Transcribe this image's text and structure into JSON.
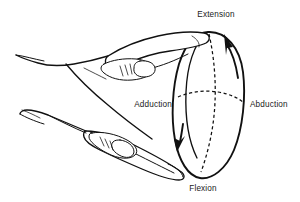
{
  "figure": {
    "background_color": "#ffffff",
    "ink_color": "#111111"
  },
  "labels": {
    "extension": "Extension",
    "abduction": "Abduction",
    "adduction": "Adduction",
    "flexion": "Flexion"
  },
  "label_positions": {
    "extension": {
      "x": 216,
      "y": 17
    },
    "abduction": {
      "x": 268,
      "y": 104
    },
    "adduction": {
      "x": 162,
      "y": 104
    },
    "flexion": {
      "x": 203,
      "y": 188
    }
  },
  "anatomy": {
    "parts": [
      "hand-outline",
      "index-finger",
      "thumb-finger",
      "index-fingernail",
      "thumb-fingernail",
      "index-knuckle-creases",
      "thumb-knuckle-creases",
      "wrist-edge"
    ]
  },
  "motion_cone": {
    "description": "Conic envelope of wrist motion drawn as an ellipse with dashed major and minor axes",
    "axes": [
      "vertical-dashed-axis",
      "horizontal-dashed-axis"
    ],
    "arrows": [
      {
        "name": "extension-arrow",
        "direction": "up",
        "position": "upper-right"
      },
      {
        "name": "flexion-arrow",
        "direction": "down",
        "position": "lower-left"
      }
    ]
  }
}
